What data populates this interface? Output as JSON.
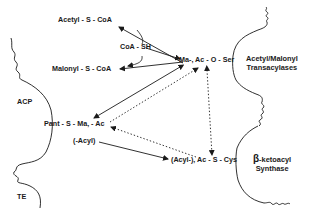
{
  "diagram": {
    "nodes": {
      "acetyl_coa": "Acetyl - S - CoA",
      "coa_sh": "CoA - SH",
      "malonyl_coa": "Malonyl - S - CoA",
      "ser_center": "Ma-, Ac - O - Ser",
      "pant_center": "Pant - S - Ma, - Ac",
      "acyl": "(-Acyl)",
      "cys_center": "(Acyl-), Ac - S - Cys"
    },
    "domains": {
      "acp": "ACP",
      "te": "TE",
      "transacylases_line1": "Acetyl/Malonyl",
      "transacylases_line2": "Transacylases",
      "ks_beta": "β",
      "ks_line1": "-ketoacyl",
      "ks_line2": "Synthase"
    },
    "edges": [
      {
        "from": "ser_center",
        "to": "acetyl_coa",
        "style": "solid"
      },
      {
        "from": "malonyl_coa",
        "to": "ser_center",
        "style": "solid"
      },
      {
        "from": "acetyl_coa",
        "to": "malonyl_coa",
        "style": "solid-curved",
        "via": "coa_sh"
      },
      {
        "from": "ser_center",
        "to": "pant_center",
        "style": "solid-bidirectional"
      },
      {
        "from": "pant_center",
        "to": "ser_center",
        "style": "dotted"
      },
      {
        "from": "cys_center",
        "to": "pant_center",
        "style": "dotted"
      },
      {
        "from": "cys_center",
        "to": "ser_center",
        "style": "dotted"
      },
      {
        "from": "acyl",
        "to": "cys_center",
        "style": "solid"
      }
    ]
  }
}
